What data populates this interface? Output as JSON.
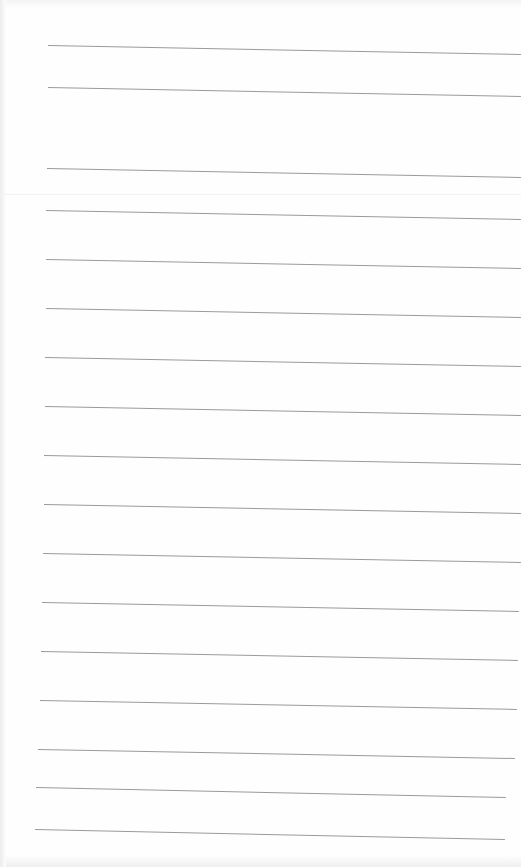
{
  "image": {
    "description": "Photo of blank lined notebook paper",
    "background_color": "#fdfdfd",
    "line_color": "#9a9a9a"
  },
  "lines": [
    {
      "x1": 48,
      "y1": 45,
      "x2": 521,
      "y2": 54
    },
    {
      "x1": 48,
      "y1": 87,
      "x2": 521,
      "y2": 96
    },
    {
      "x1": 47,
      "y1": 168,
      "x2": 521,
      "y2": 177
    },
    {
      "x1": 46,
      "y1": 210,
      "x2": 521,
      "y2": 219
    },
    {
      "x1": 46,
      "y1": 259,
      "x2": 521,
      "y2": 268
    },
    {
      "x1": 46,
      "y1": 308,
      "x2": 521,
      "y2": 317
    },
    {
      "x1": 45,
      "y1": 357,
      "x2": 521,
      "y2": 366
    },
    {
      "x1": 45,
      "y1": 406,
      "x2": 521,
      "y2": 415
    },
    {
      "x1": 44,
      "y1": 455,
      "x2": 521,
      "y2": 464
    },
    {
      "x1": 44,
      "y1": 504,
      "x2": 521,
      "y2": 513
    },
    {
      "x1": 43,
      "y1": 553,
      "x2": 521,
      "y2": 562
    },
    {
      "x1": 42,
      "y1": 602,
      "x2": 519,
      "y2": 611
    },
    {
      "x1": 41,
      "y1": 651,
      "x2": 518,
      "y2": 660
    },
    {
      "x1": 40,
      "y1": 700,
      "x2": 517,
      "y2": 709
    },
    {
      "x1": 38,
      "y1": 749,
      "x2": 515,
      "y2": 758
    },
    {
      "x1": 36,
      "y1": 787,
      "x2": 506,
      "y2": 797
    },
    {
      "x1": 35,
      "y1": 829,
      "x2": 505,
      "y2": 839
    }
  ]
}
